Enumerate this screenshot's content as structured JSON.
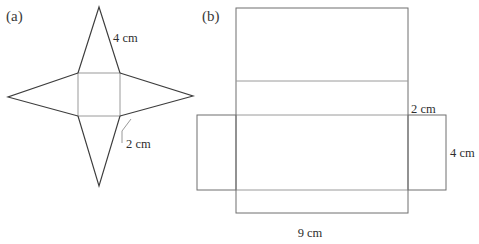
{
  "figure": {
    "background_color": "#ffffff",
    "stroke_color_dark": "#3d3d3d",
    "stroke_color_mid": "#6f6f6f",
    "stroke_color_light": "#9a9a9a",
    "text_color": "#2e2e2e",
    "panels": [
      {
        "id": "a",
        "label": "(a)",
        "label_x": 6,
        "label_y": 21,
        "description": "four-pointed-star-net",
        "center_square": {
          "x": 78,
          "y": 73,
          "width": 42,
          "height": 43
        },
        "star_tips": {
          "top": {
            "x": 99,
            "y": 7
          },
          "bottom": {
            "x": 99,
            "y": 186
          },
          "left": {
            "x": 8,
            "y": 97
          },
          "right": {
            "x": 193,
            "y": 96
          }
        },
        "dimensions": [
          {
            "name": "slant-height",
            "text": "4 cm",
            "x": 113,
            "y": 42,
            "leader": false
          },
          {
            "name": "base-edge",
            "text": "2 cm",
            "x": 126,
            "y": 148,
            "leader": true,
            "leader_path": "M 122 143 L 122 131 L 131 119"
          }
        ]
      },
      {
        "id": "b",
        "label": "(b)",
        "label_x": 202,
        "label_y": 21,
        "description": "rectangular-prism-net",
        "main_column": {
          "x": 236,
          "y": 8,
          "width": 172,
          "height": 205
        },
        "fold_lines_y": [
          81,
          115,
          190
        ],
        "left_flap": {
          "x": 197,
          "y": 115,
          "width": 39,
          "height": 75
        },
        "right_flap": {
          "x": 408,
          "y": 115,
          "width": 38,
          "height": 75
        },
        "dimensions": [
          {
            "name": "depth",
            "text": "2 cm",
            "x": 411,
            "y": 113
          },
          {
            "name": "height",
            "text": "4 cm",
            "x": 450,
            "y": 157
          },
          {
            "name": "width",
            "text": "9 cm",
            "x": 310,
            "y": 237
          }
        ]
      }
    ]
  }
}
